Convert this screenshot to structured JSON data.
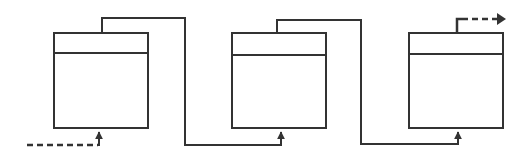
{
  "diagram": {
    "colors": {
      "stroke": "#333333",
      "background": "#ffffff"
    },
    "boxes": [
      {
        "id": "box-1",
        "x": 54,
        "y": 33,
        "w": 94,
        "h": 95,
        "divider_y": 53
      },
      {
        "id": "box-2",
        "x": 232,
        "y": 33,
        "w": 94,
        "h": 95,
        "divider_y": 55
      },
      {
        "id": "box-3",
        "x": 409,
        "y": 33,
        "w": 94,
        "h": 95,
        "divider_y": 54
      }
    ],
    "connectors": [
      {
        "id": "input",
        "style": "dashed",
        "label": ""
      },
      {
        "id": "box1-to-box2",
        "style": "solid",
        "label": ""
      },
      {
        "id": "box2-to-box3",
        "style": "solid",
        "label": ""
      },
      {
        "id": "output",
        "style": "dashed",
        "label": ""
      }
    ]
  }
}
